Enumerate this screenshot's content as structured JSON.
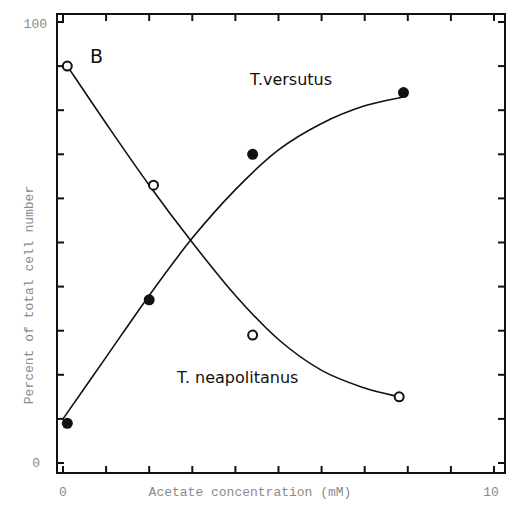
{
  "chart_data": {
    "type": "scatter",
    "panel_label": "B",
    "title": "",
    "xlabel": "Acetate concentration (mM)",
    "ylabel": "Percent of total cell number",
    "xlim": [
      0,
      10
    ],
    "ylim": [
      0,
      100
    ],
    "x_tick_labels": [
      "0",
      "10"
    ],
    "y_tick_labels": [
      "0",
      "100"
    ],
    "x_minor_ticks": [
      0,
      1,
      2,
      3,
      4,
      5,
      6,
      7,
      8,
      9,
      10
    ],
    "y_minor_ticks": [
      0,
      10,
      20,
      30,
      40,
      50,
      60,
      70,
      80,
      90,
      100
    ],
    "grid": false,
    "legend": "inline annotations",
    "series": [
      {
        "name": "T.versutus",
        "marker": "filled-circle",
        "x": [
          0.1,
          2.0,
          4.4,
          7.9
        ],
        "y": [
          9,
          37,
          70,
          84
        ],
        "fit_curve": [
          [
            0,
            10
          ],
          [
            1,
            24
          ],
          [
            2,
            38
          ],
          [
            3,
            51
          ],
          [
            4,
            62
          ],
          [
            5,
            71
          ],
          [
            6,
            77
          ],
          [
            7,
            81
          ],
          [
            7.9,
            83
          ]
        ]
      },
      {
        "name": "T. neapolitanus",
        "marker": "open-circle",
        "x": [
          0.1,
          2.1,
          4.4,
          7.8
        ],
        "y": [
          90,
          63,
          29,
          15
        ],
        "fit_curve": [
          [
            0.1,
            90
          ],
          [
            1,
            77
          ],
          [
            2,
            63
          ],
          [
            3,
            50
          ],
          [
            4,
            38
          ],
          [
            5,
            28
          ],
          [
            6,
            21
          ],
          [
            7,
            17
          ],
          [
            7.8,
            15
          ]
        ]
      }
    ],
    "annotations": [
      {
        "text": "T.versutus",
        "near_x": 4.4,
        "near_y": 85
      },
      {
        "text": "T. neapolitanus",
        "near_x": 2.6,
        "near_y": 18
      },
      {
        "text": "B",
        "near_x": 0.6,
        "near_y": 91
      }
    ]
  }
}
